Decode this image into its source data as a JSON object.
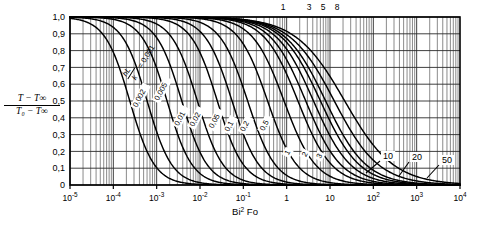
{
  "chart_data": {
    "type": "line",
    "title": "",
    "xlabel": "Bi² Fo",
    "ylabel_numerator": "T − T∞",
    "ylabel_denominator": "T₀ − T∞",
    "xscale": "log",
    "xlim": [
      1e-05,
      10000
    ],
    "ylim": [
      0,
      1
    ],
    "grid": true,
    "legend_position": "inline-curve-labels",
    "x_tick_labels": [
      "10⁻⁵",
      "10⁻⁴",
      "10⁻³",
      "10⁻²",
      "10⁻¹",
      "1",
      "10",
      "10²",
      "10³",
      "10⁴"
    ],
    "x_tick_values": [
      1e-05,
      0.0001,
      0.001,
      0.01,
      0.1,
      1,
      10,
      100,
      1000,
      10000
    ],
    "y_tick_labels": [
      "1,0",
      "0,9",
      "0,8",
      "0,7",
      "0,6",
      "0,5",
      "0,4",
      "0,3",
      "0,2",
      "0,1",
      "0"
    ],
    "y_tick_values": [
      1.0,
      0.9,
      0.8,
      0.7,
      0.6,
      0.5,
      0.4,
      0.3,
      0.2,
      0.1,
      0.0
    ],
    "top_tick_labels": [
      "1",
      "3",
      "5",
      "8"
    ],
    "top_tick_values": [
      1,
      3,
      5,
      8
    ],
    "parameter_name": "hL/k",
    "parameter_prefix": "hL",
    "parameter_divisor": "k",
    "parameter_equals": "= 0,001",
    "series": [
      {
        "name": "0,001",
        "label": "0,001",
        "bi": 0.001,
        "label_x": 0.000115,
        "label_y": 0.45,
        "label_rot": -62,
        "inline": true
      },
      {
        "name": "0,002",
        "label": "0,002",
        "bi": 0.002,
        "label_x": 0.00035,
        "label_y": 0.46,
        "label_rot": -62,
        "inline": true
      },
      {
        "name": "0,005",
        "label": "0,005",
        "bi": 0.005,
        "label_x": 0.0011,
        "label_y": 0.5,
        "label_rot": -62,
        "inline": true
      },
      {
        "name": "0,01",
        "label": "0,01",
        "bi": 0.01,
        "label_x": 0.0032,
        "label_y": 0.35,
        "label_rot": -62,
        "inline": true
      },
      {
        "name": "0,02",
        "label": "0,02",
        "bi": 0.02,
        "label_x": 0.0072,
        "label_y": 0.345,
        "label_rot": -62,
        "inline": true
      },
      {
        "name": "0,05",
        "label": "0,05",
        "bi": 0.05,
        "label_x": 0.02,
        "label_y": 0.335,
        "label_rot": -62,
        "inline": true
      },
      {
        "name": "0,1",
        "label": "0,1",
        "bi": 0.1,
        "label_x": 0.046,
        "label_y": 0.315,
        "label_rot": -62,
        "inline": true
      },
      {
        "name": "0,2",
        "label": "0,2",
        "bi": 0.2,
        "label_x": 0.105,
        "label_y": 0.315,
        "label_rot": -62,
        "inline": true
      },
      {
        "name": "0,5",
        "label": "0,5",
        "bi": 0.5,
        "label_x": 0.3,
        "label_y": 0.32,
        "label_rot": -62,
        "inline": true
      },
      {
        "name": "1",
        "label": "1",
        "bi": 1,
        "label_x": 1.1,
        "label_y": 0.175,
        "label_rot": -62,
        "inline": true
      },
      {
        "name": "2",
        "label": "2",
        "bi": 2,
        "label_x": 2.8,
        "label_y": 0.165,
        "label_rot": -62,
        "inline": true
      },
      {
        "name": "3",
        "label": "3",
        "bi": 3,
        "label_x": 6.0,
        "label_y": 0.155,
        "label_rot": -62,
        "inline": true
      },
      {
        "name": "5",
        "label": "5",
        "bi": 5,
        "label_x": 0,
        "label_y": 0,
        "label_rot": 0,
        "inline": false
      },
      {
        "name": "8",
        "label": "8",
        "bi": 8,
        "label_x": 0,
        "label_y": 0,
        "label_rot": 0,
        "inline": false
      },
      {
        "name": "10",
        "label": "10",
        "bi": 10,
        "label_x": 160,
        "label_y": 0.175,
        "label_rot": 0,
        "inline": false,
        "leader": true
      },
      {
        "name": "20",
        "label": "20",
        "bi": 20,
        "label_x": 420,
        "label_y": 0.185,
        "label_rot": 0,
        "inline": false,
        "leader": true
      },
      {
        "name": "50",
        "label": "50",
        "bi": 50,
        "label_x": 1500,
        "label_y": 0.145,
        "label_rot": 0,
        "inline": false,
        "leader": true
      }
    ],
    "curve_color": "#000000",
    "grid_color": "#2a2a2a",
    "background": "#ffffff"
  }
}
